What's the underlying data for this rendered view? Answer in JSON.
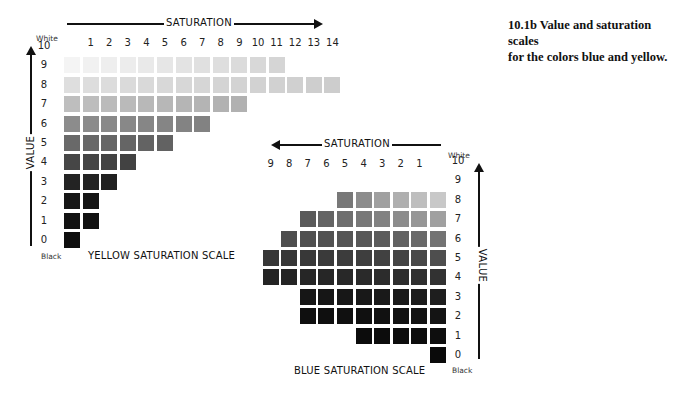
{
  "caption": {
    "line1": "10.1b Value and saturation scales",
    "line2": "for the colors blue and yellow."
  },
  "yellow_scale": {
    "title": "YELLOW SATURATION SCALE",
    "saturation_label": "SATURATION",
    "value_label": "VALUE",
    "white_label": "White",
    "black_label": "Black",
    "saturation_ticks": [
      "1",
      "2",
      "3",
      "4",
      "5",
      "6",
      "7",
      "8",
      "9",
      "10",
      "11",
      "12",
      "13",
      "14"
    ],
    "value_ticks": [
      "10",
      "9",
      "8",
      "7",
      "6",
      "5",
      "4",
      "3",
      "2",
      "1",
      "0"
    ],
    "rows": [
      {
        "value": 9,
        "count": 12
      },
      {
        "value": 8,
        "count": 15
      },
      {
        "value": 7,
        "count": 10
      },
      {
        "value": 6,
        "count": 8
      },
      {
        "value": 5,
        "count": 6
      },
      {
        "value": 4,
        "count": 4
      },
      {
        "value": 3,
        "count": 3
      },
      {
        "value": 2,
        "count": 2
      },
      {
        "value": 1,
        "count": 2
      },
      {
        "value": 0,
        "count": 1
      }
    ]
  },
  "blue_scale": {
    "title": "BLUE SATURATION SCALE",
    "saturation_label": "SATURATION",
    "value_label": "VALUE",
    "white_label": "White",
    "black_label": "Black",
    "saturation_ticks": [
      "9",
      "8",
      "7",
      "6",
      "5",
      "4",
      "3",
      "2",
      "1"
    ],
    "value_ticks": [
      "10",
      "9",
      "8",
      "7",
      "6",
      "5",
      "4",
      "3",
      "2",
      "1",
      "0"
    ],
    "rows": [
      {
        "value": 8,
        "count": 6
      },
      {
        "value": 7,
        "count": 8
      },
      {
        "value": 6,
        "count": 9
      },
      {
        "value": 5,
        "count": 10
      },
      {
        "value": 4,
        "count": 10
      },
      {
        "value": 3,
        "count": 8
      },
      {
        "value": 2,
        "count": 8
      },
      {
        "value": 1,
        "count": 5
      },
      {
        "value": 0,
        "count": 1
      }
    ]
  }
}
